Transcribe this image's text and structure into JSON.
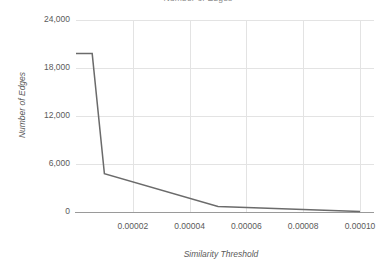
{
  "chart_data": {
    "type": "line",
    "title": "Number of Edges",
    "xlabel": "Similarity Threshold",
    "ylabel": "Number of Edges",
    "xlim": [
      0.0,
      0.0001
    ],
    "ylim": [
      0,
      24000
    ],
    "grid": true,
    "legend": "none",
    "line_color": "#6b6b6b",
    "gridline_color": "#e3e3e3",
    "axis_color": "#9a9a9a",
    "x_ticks": [
      "0.00002",
      "0.00004",
      "0.00006",
      "0.00008",
      "0.00010"
    ],
    "x_tick_values": [
      2e-05,
      4e-05,
      6e-05,
      8e-05,
      0.0001
    ],
    "y_ticks": [
      "0",
      "6,000",
      "12,000",
      "18,000",
      "24,000"
    ],
    "y_tick_values": [
      0,
      6000,
      12000,
      18000,
      24000
    ],
    "series": [
      {
        "name": "Number of Edges",
        "x": [
          0.0,
          5.7e-06,
          1e-05,
          5e-05,
          0.0001
        ],
        "values": [
          19800,
          19800,
          4800,
          700,
          60
        ]
      }
    ]
  }
}
